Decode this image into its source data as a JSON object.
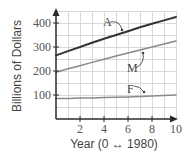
{
  "chart_data": {
    "type": "line",
    "title": "",
    "xlabel": "Year (0 ↔ 1980)",
    "ylabel": "Billions of Dollars",
    "xlim": [
      0,
      10
    ],
    "ylim": [
      0,
      450
    ],
    "x_ticks": [
      2,
      4,
      6,
      8,
      10
    ],
    "y_ticks": [
      100,
      200,
      300,
      400
    ],
    "grid": true,
    "legend_position": "inline labels with arrows",
    "x": [
      0,
      1,
      2,
      3,
      4,
      5,
      6,
      7,
      8,
      9,
      10
    ],
    "series": [
      {
        "name": "A",
        "color": "#333333",
        "values": [
          265,
          283,
          300,
          318,
          334,
          350,
          366,
          382,
          397,
          411,
          425
        ]
      },
      {
        "name": "M",
        "color": "#8a8a8a",
        "values": [
          195,
          209,
          222,
          236,
          249,
          262,
          275,
          288,
          300,
          313,
          325
        ]
      },
      {
        "name": "F",
        "color": "#8a8a8a",
        "values": [
          85,
          86,
          87,
          88,
          89,
          91,
          92,
          94,
          96,
          98,
          100
        ]
      }
    ]
  }
}
